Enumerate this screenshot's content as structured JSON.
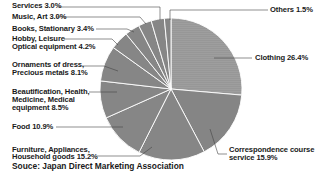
{
  "chart_data": {
    "type": "pie",
    "title": "",
    "start_angle_deg": 0,
    "direction": "clockwise",
    "slices": [
      {
        "label": "Clothing",
        "value": 26.4,
        "display": "Clothing 26.4%",
        "color": "#9c9c9c"
      },
      {
        "label": "Correspondence course service",
        "value": 15.9,
        "display": "Correspondence course service 15.9%",
        "color": "#858585"
      },
      {
        "label": "Furniture, Appliances, Household goods",
        "value": 15.2,
        "display": "Furniture, Appliances, Household goods 15.2%",
        "color": "#868686"
      },
      {
        "label": "Food",
        "value": 10.9,
        "display": "Food 10.9%",
        "color": "#868686"
      },
      {
        "label": "Beautification, Health, Medicine, Medical equipment",
        "value": 8.5,
        "display": "Beautification, Health, Medicine, Medical equipment 8.5%",
        "color": "#868686"
      },
      {
        "label": "Ornaments of dress, Precious metals",
        "value": 8.1,
        "display": "Ornaments of dress, Precious metals 8.1%",
        "color": "#868686"
      },
      {
        "label": "Hobby, Leisure Optical equipment",
        "value": 4.2,
        "display": "Hobby, Leisure Optical equipment 4.2%",
        "color": "#868686"
      },
      {
        "label": "Books, Stationary",
        "value": 3.4,
        "display": "Books, Stationary 3.4%",
        "color": "#868686"
      },
      {
        "label": "Music, Art",
        "value": 3.0,
        "display": "Music, Art 3.0%",
        "color": "#868686"
      },
      {
        "label": "Services",
        "value": 3.0,
        "display": "Services 3.0%",
        "color": "#868686"
      },
      {
        "label": "Others",
        "value": 1.5,
        "display": "Others 1.5%",
        "color": "#868686"
      }
    ],
    "legend": "none (leader-line labels)",
    "source": "Souce: Japan Direct Marketing Association"
  },
  "labels": {
    "services": "Services 3.0%",
    "music": "Music, Art 3.0%",
    "books": "Books, Stationary 3.4%",
    "hobby_1": "Hobby, Leisure",
    "hobby_2": "Optical equipment 4.2%",
    "ornaments_1": "Ornaments of dress,",
    "ornaments_2": "Precious metals 8.1%",
    "beauty_1": "Beautification, Health,",
    "beauty_2": "Medicine, Medical",
    "beauty_3": "equipment 8.5%",
    "food": "Food 10.9%",
    "furniture_1": "Furniture, Appliances,",
    "furniture_2": "Household goods 15.2%",
    "others": "Others 1.5%",
    "clothing": "Clothing 26.4%",
    "corr_1": "Correspondence course",
    "corr_2": "service 15.9%"
  },
  "source": "Souce: Japan Direct Marketing Association",
  "colors": {
    "clothing": "#9c9c9c",
    "slice": "#868686",
    "separator": "#ffffff",
    "leader": "#333333"
  }
}
